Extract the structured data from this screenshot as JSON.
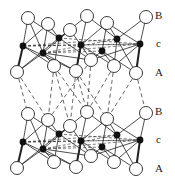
{
  "diagram": {
    "type": "layered crystal structure",
    "layers": [
      {
        "name": "top-slab",
        "offset_y": 0
      },
      {
        "name": "bottom-slab",
        "offset_y": 96
      }
    ],
    "labels": {
      "top": {
        "B": "B",
        "c": "c",
        "A": "A"
      },
      "bottom": {
        "B": "B",
        "c": "c",
        "A": "A"
      }
    },
    "colors": {
      "line": "#222222",
      "atom_open_fill": "#ffffff",
      "atom_filled": "#111111"
    },
    "slab": {
      "B_atoms": [
        [
          28,
          18
        ],
        [
          48,
          24
        ],
        [
          70,
          30
        ],
        [
          87,
          16
        ],
        [
          107,
          23
        ],
        [
          146,
          17
        ]
      ],
      "c_atoms": [
        [
          23,
          46
        ],
        [
          43,
          53
        ],
        [
          59,
          38
        ],
        [
          81,
          45
        ],
        [
          102,
          51
        ],
        [
          117,
          39
        ],
        [
          140,
          44
        ]
      ],
      "A_atoms": [
        [
          17,
          72
        ],
        [
          54,
          66
        ],
        [
          76,
          71
        ],
        [
          91,
          60
        ],
        [
          114,
          66
        ],
        [
          136,
          73
        ]
      ]
    }
  }
}
